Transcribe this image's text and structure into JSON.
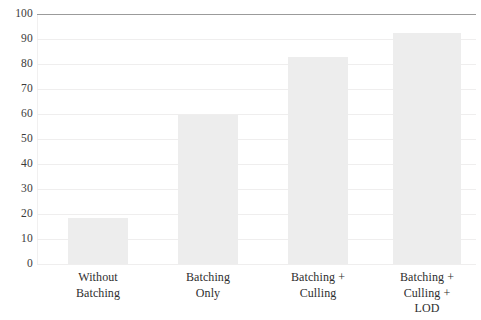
{
  "chart_data": {
    "type": "bar",
    "title": "",
    "subtitle": "",
    "xlabel": "",
    "ylabel": "",
    "categories": [
      "Without Batching",
      "Batching Only",
      "Batching + Culling",
      "Batching + Culling + LOD"
    ],
    "category_lines": [
      [
        "Without",
        "Batching"
      ],
      [
        "Batching",
        "Only"
      ],
      [
        "Batching +",
        "Culling"
      ],
      [
        "Batching +",
        "Culling +",
        "LOD"
      ]
    ],
    "values": [
      18.5,
      59.5,
      83,
      92.5
    ],
    "ylim": [
      0,
      100
    ],
    "ytick_step": 10,
    "yticks": [
      100,
      90,
      80,
      70,
      60,
      50,
      40,
      30,
      20,
      10,
      0
    ],
    "ytick_labels": [
      "100",
      "90",
      "80",
      "70",
      "60",
      "50",
      "40",
      "30",
      "20",
      "10",
      "0"
    ],
    "grid": true,
    "grid_axis": "y",
    "legend": null,
    "legend_position": "none",
    "bar_color": "#ededed",
    "grid_color": "#efeeee",
    "top_rule_color": "#9b9b9b",
    "text_color": "#2e2e2e",
    "background": "#ffffff"
  }
}
